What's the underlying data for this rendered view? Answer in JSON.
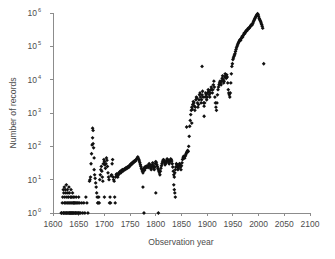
{
  "chart_data": {
    "type": "scatter",
    "title": "",
    "xlabel": "Observation year",
    "ylabel": "Number of records",
    "xlim": [
      1600,
      2100
    ],
    "ylim": [
      1,
      1000000
    ],
    "yscale": "log",
    "xscale": "linear",
    "grid": false,
    "legend": null,
    "marker": "diamond",
    "marker_color": "#111111",
    "xticks": [
      1600,
      1650,
      1700,
      1750,
      1800,
      1850,
      1900,
      1950,
      2000,
      2050,
      2100
    ],
    "xtick_labels": [
      "1600",
      "1650",
      "1700",
      "1750",
      "1800",
      "1850",
      "1900",
      "1950",
      "2000",
      "2050",
      "2100"
    ],
    "yticks": [
      1,
      10,
      100,
      1000,
      10000,
      100000,
      1000000
    ],
    "ytick_labels": [
      "10⁰",
      "10¹",
      "10²",
      "10³",
      "10⁴",
      "10⁵",
      "10⁶"
    ],
    "ytick_mantissa": [
      "10",
      "10",
      "10",
      "10",
      "10",
      "10",
      "10"
    ],
    "ytick_exponent": [
      "0",
      "1",
      "2",
      "3",
      "4",
      "5",
      "6"
    ],
    "points": [
      [
        1616,
        1
      ],
      [
        1617,
        1
      ],
      [
        1618,
        2
      ],
      [
        1619,
        3
      ],
      [
        1620,
        1
      ],
      [
        1620,
        5
      ],
      [
        1621,
        1
      ],
      [
        1621,
        4
      ],
      [
        1622,
        2
      ],
      [
        1622,
        6
      ],
      [
        1623,
        1
      ],
      [
        1623,
        3
      ],
      [
        1624,
        2
      ],
      [
        1624,
        5
      ],
      [
        1625,
        1
      ],
      [
        1625,
        4
      ],
      [
        1626,
        1
      ],
      [
        1626,
        7
      ],
      [
        1627,
        2
      ],
      [
        1627,
        3
      ],
      [
        1628,
        1
      ],
      [
        1628,
        5
      ],
      [
        1629,
        2
      ],
      [
        1629,
        4
      ],
      [
        1630,
        1
      ],
      [
        1630,
        3
      ],
      [
        1631,
        2
      ],
      [
        1631,
        6
      ],
      [
        1632,
        1
      ],
      [
        1632,
        4
      ],
      [
        1633,
        1
      ],
      [
        1633,
        2
      ],
      [
        1634,
        1
      ],
      [
        1634,
        3
      ],
      [
        1635,
        2
      ],
      [
        1635,
        5
      ],
      [
        1636,
        1
      ],
      [
        1636,
        3
      ],
      [
        1637,
        1
      ],
      [
        1637,
        2
      ],
      [
        1638,
        1
      ],
      [
        1638,
        4
      ],
      [
        1639,
        2
      ],
      [
        1639,
        3
      ],
      [
        1640,
        1
      ],
      [
        1640,
        2
      ],
      [
        1641,
        1
      ],
      [
        1641,
        3
      ],
      [
        1642,
        2
      ],
      [
        1643,
        1
      ],
      [
        1643,
        2
      ],
      [
        1644,
        1
      ],
      [
        1645,
        2
      ],
      [
        1645,
        3
      ],
      [
        1646,
        1
      ],
      [
        1647,
        2
      ],
      [
        1648,
        1
      ],
      [
        1649,
        2
      ],
      [
        1650,
        1
      ],
      [
        1650,
        3
      ],
      [
        1651,
        1
      ],
      [
        1652,
        2
      ],
      [
        1654,
        1
      ],
      [
        1656,
        2
      ],
      [
        1658,
        1
      ],
      [
        1660,
        2
      ],
      [
        1662,
        1
      ],
      [
        1664,
        3
      ],
      [
        1666,
        2
      ],
      [
        1668,
        1
      ],
      [
        1671,
        9
      ],
      [
        1672,
        10
      ],
      [
        1673,
        12
      ],
      [
        1674,
        30
      ],
      [
        1675,
        60
      ],
      [
        1676,
        110
      ],
      [
        1677,
        180
      ],
      [
        1677,
        350
      ],
      [
        1678,
        300
      ],
      [
        1678,
        120
      ],
      [
        1679,
        90
      ],
      [
        1680,
        45
      ],
      [
        1680,
        20
      ],
      [
        1681,
        14
      ],
      [
        1682,
        11
      ],
      [
        1683,
        8
      ],
      [
        1684,
        6
      ],
      [
        1685,
        4
      ],
      [
        1686,
        3
      ],
      [
        1687,
        2
      ],
      [
        1688,
        2
      ],
      [
        1689,
        3
      ],
      [
        1690,
        2
      ],
      [
        1691,
        10
      ],
      [
        1692,
        14
      ],
      [
        1693,
        20
      ],
      [
        1694,
        25
      ],
      [
        1695,
        18
      ],
      [
        1696,
        12
      ],
      [
        1697,
        9
      ],
      [
        1698,
        30
      ],
      [
        1699,
        40
      ],
      [
        1700,
        35
      ],
      [
        1700,
        3
      ],
      [
        1701,
        28
      ],
      [
        1702,
        22
      ],
      [
        1703,
        30
      ],
      [
        1704,
        45
      ],
      [
        1705,
        38
      ],
      [
        1706,
        25
      ],
      [
        1707,
        16
      ],
      [
        1708,
        12
      ],
      [
        1709,
        10
      ],
      [
        1710,
        2
      ],
      [
        1711,
        3
      ],
      [
        1712,
        2
      ],
      [
        1713,
        13
      ],
      [
        1714,
        14
      ],
      [
        1715,
        30
      ],
      [
        1716,
        40
      ],
      [
        1717,
        12
      ],
      [
        1718,
        10
      ],
      [
        1719,
        9
      ],
      [
        1720,
        3
      ],
      [
        1721,
        2
      ],
      [
        1722,
        12
      ],
      [
        1723,
        14
      ],
      [
        1724,
        15
      ],
      [
        1725,
        13
      ],
      [
        1726,
        12
      ],
      [
        1727,
        14
      ],
      [
        1728,
        16
      ],
      [
        1729,
        15
      ],
      [
        1730,
        17
      ],
      [
        1731,
        18
      ],
      [
        1732,
        16
      ],
      [
        1733,
        17
      ],
      [
        1734,
        19
      ],
      [
        1735,
        20
      ],
      [
        1736,
        18
      ],
      [
        1737,
        19
      ],
      [
        1738,
        20
      ],
      [
        1739,
        21
      ],
      [
        1740,
        20
      ],
      [
        1741,
        22
      ],
      [
        1742,
        21
      ],
      [
        1743,
        23
      ],
      [
        1744,
        22
      ],
      [
        1745,
        24
      ],
      [
        1746,
        23
      ],
      [
        1747,
        25
      ],
      [
        1748,
        24
      ],
      [
        1749,
        26
      ],
      [
        1750,
        28
      ],
      [
        1751,
        27
      ],
      [
        1752,
        30
      ],
      [
        1753,
        29
      ],
      [
        1754,
        32
      ],
      [
        1755,
        31
      ],
      [
        1756,
        34
      ],
      [
        1757,
        33
      ],
      [
        1758,
        36
      ],
      [
        1759,
        35
      ],
      [
        1760,
        38
      ],
      [
        1761,
        37
      ],
      [
        1762,
        40
      ],
      [
        1763,
        42
      ],
      [
        1764,
        45
      ],
      [
        1765,
        48
      ],
      [
        1766,
        44
      ],
      [
        1767,
        40
      ],
      [
        1768,
        36
      ],
      [
        1769,
        32
      ],
      [
        1770,
        28
      ],
      [
        1771,
        25
      ],
      [
        1772,
        22
      ],
      [
        1773,
        20
      ],
      [
        1774,
        18
      ],
      [
        1775,
        16
      ],
      [
        1775,
        6
      ],
      [
        1776,
        20
      ],
      [
        1777,
        22
      ],
      [
        1777,
        1
      ],
      [
        1778,
        19
      ],
      [
        1779,
        24
      ],
      [
        1780,
        22
      ],
      [
        1781,
        25
      ],
      [
        1782,
        24
      ],
      [
        1783,
        26
      ],
      [
        1784,
        25
      ],
      [
        1785,
        23
      ],
      [
        1786,
        27
      ],
      [
        1787,
        30
      ],
      [
        1788,
        28
      ],
      [
        1789,
        25
      ],
      [
        1790,
        22
      ],
      [
        1791,
        20
      ],
      [
        1792,
        24
      ],
      [
        1793,
        28
      ],
      [
        1794,
        32
      ],
      [
        1795,
        26
      ],
      [
        1796,
        22
      ],
      [
        1797,
        20
      ],
      [
        1798,
        24
      ],
      [
        1799,
        30
      ],
      [
        1800,
        35
      ],
      [
        1800,
        4
      ],
      [
        1801,
        32
      ],
      [
        1802,
        28
      ],
      [
        1803,
        25
      ],
      [
        1804,
        22
      ],
      [
        1805,
        20
      ],
      [
        1805,
        1
      ],
      [
        1806,
        18
      ],
      [
        1807,
        16
      ],
      [
        1808,
        14
      ],
      [
        1809,
        18
      ],
      [
        1810,
        22
      ],
      [
        1811,
        26
      ],
      [
        1812,
        30
      ],
      [
        1813,
        34
      ],
      [
        1814,
        38
      ],
      [
        1815,
        40
      ],
      [
        1816,
        36
      ],
      [
        1817,
        32
      ],
      [
        1818,
        28
      ],
      [
        1819,
        30
      ],
      [
        1820,
        34
      ],
      [
        1821,
        38
      ],
      [
        1822,
        42
      ],
      [
        1823,
        40
      ],
      [
        1824,
        36
      ],
      [
        1825,
        32
      ],
      [
        1826,
        30
      ],
      [
        1827,
        34
      ],
      [
        1828,
        38
      ],
      [
        1829,
        42
      ],
      [
        1830,
        40
      ],
      [
        1831,
        36
      ],
      [
        1832,
        30
      ],
      [
        1833,
        24
      ],
      [
        1834,
        18
      ],
      [
        1835,
        14
      ],
      [
        1835,
        7
      ],
      [
        1836,
        12
      ],
      [
        1836,
        5
      ],
      [
        1837,
        16
      ],
      [
        1837,
        4
      ],
      [
        1838,
        20
      ],
      [
        1838,
        3
      ],
      [
        1839,
        24
      ],
      [
        1840,
        30
      ],
      [
        1841,
        28
      ],
      [
        1842,
        24
      ],
      [
        1843,
        20
      ],
      [
        1844,
        22
      ],
      [
        1845,
        26
      ],
      [
        1846,
        30
      ],
      [
        1847,
        28
      ],
      [
        1848,
        24
      ],
      [
        1849,
        20
      ],
      [
        1850,
        26
      ],
      [
        1851,
        32
      ],
      [
        1852,
        40
      ],
      [
        1853,
        45
      ],
      [
        1854,
        50
      ],
      [
        1855,
        48
      ],
      [
        1856,
        44
      ],
      [
        1857,
        50
      ],
      [
        1858,
        55
      ],
      [
        1859,
        60
      ],
      [
        1860,
        65
      ],
      [
        1860,
        380
      ],
      [
        1861,
        70
      ],
      [
        1862,
        75
      ],
      [
        1863,
        70
      ],
      [
        1864,
        100
      ],
      [
        1865,
        200
      ],
      [
        1866,
        400
      ],
      [
        1867,
        600
      ],
      [
        1868,
        900
      ],
      [
        1869,
        1200
      ],
      [
        1870,
        1500
      ],
      [
        1870,
        500
      ],
      [
        1871,
        1300
      ],
      [
        1872,
        1800
      ],
      [
        1873,
        2200
      ],
      [
        1874,
        2000
      ],
      [
        1875,
        1600
      ],
      [
        1876,
        1200
      ],
      [
        1877,
        1500
      ],
      [
        1878,
        2500
      ],
      [
        1879,
        3000
      ],
      [
        1880,
        2800
      ],
      [
        1881,
        2000
      ],
      [
        1882,
        1500
      ],
      [
        1883,
        1800
      ],
      [
        1884,
        2500
      ],
      [
        1885,
        3500
      ],
      [
        1886,
        4000
      ],
      [
        1887,
        3000
      ],
      [
        1888,
        2000
      ],
      [
        1889,
        2500
      ],
      [
        1890,
        3500
      ],
      [
        1890,
        25000
      ],
      [
        1891,
        4500
      ],
      [
        1892,
        3000
      ],
      [
        1893,
        2000
      ],
      [
        1894,
        1600
      ],
      [
        1894,
        800
      ],
      [
        1895,
        2000
      ],
      [
        1896,
        3000
      ],
      [
        1897,
        4000
      ],
      [
        1898,
        3500
      ],
      [
        1899,
        2500
      ],
      [
        1900,
        3000
      ],
      [
        1901,
        4000
      ],
      [
        1902,
        5000
      ],
      [
        1903,
        4500
      ],
      [
        1904,
        3500
      ],
      [
        1905,
        3000
      ],
      [
        1906,
        4000
      ],
      [
        1907,
        5000
      ],
      [
        1908,
        6000
      ],
      [
        1909,
        5000
      ],
      [
        1910,
        4000
      ],
      [
        1911,
        5000
      ],
      [
        1912,
        7000
      ],
      [
        1913,
        9000
      ],
      [
        1914,
        6000
      ],
      [
        1915,
        3000
      ],
      [
        1916,
        2000
      ],
      [
        1917,
        1500
      ],
      [
        1918,
        1200
      ],
      [
        1919,
        2000
      ],
      [
        1920,
        3500
      ],
      [
        1921,
        5000
      ],
      [
        1922,
        6000
      ],
      [
        1923,
        7000
      ],
      [
        1924,
        8000
      ],
      [
        1925,
        9000
      ],
      [
        1926,
        8000
      ],
      [
        1927,
        7000
      ],
      [
        1928,
        9000
      ],
      [
        1929,
        11000
      ],
      [
        1930,
        13000
      ],
      [
        1931,
        10000
      ],
      [
        1932,
        8000
      ],
      [
        1933,
        9000
      ],
      [
        1934,
        12000
      ],
      [
        1935,
        15000
      ],
      [
        1936,
        13000
      ],
      [
        1937,
        11000
      ],
      [
        1938,
        14000
      ],
      [
        1939,
        12000
      ],
      [
        1940,
        8000
      ],
      [
        1941,
        5000
      ],
      [
        1942,
        4000
      ],
      [
        1943,
        3500
      ],
      [
        1944,
        3000
      ],
      [
        1945,
        4000
      ],
      [
        1946,
        8000
      ],
      [
        1947,
        15000
      ],
      [
        1948,
        25000
      ],
      [
        1949,
        30000
      ],
      [
        1950,
        40000
      ],
      [
        1951,
        45000
      ],
      [
        1952,
        50000
      ],
      [
        1953,
        55000
      ],
      [
        1954,
        60000
      ],
      [
        1955,
        70000
      ],
      [
        1956,
        80000
      ],
      [
        1957,
        90000
      ],
      [
        1958,
        100000
      ],
      [
        1959,
        110000
      ],
      [
        1960,
        120000
      ],
      [
        1961,
        130000
      ],
      [
        1962,
        140000
      ],
      [
        1963,
        150000
      ],
      [
        1964,
        160000
      ],
      [
        1965,
        150000
      ],
      [
        1966,
        170000
      ],
      [
        1967,
        180000
      ],
      [
        1968,
        200000
      ],
      [
        1969,
        190000
      ],
      [
        1970,
        210000
      ],
      [
        1971,
        230000
      ],
      [
        1972,
        250000
      ],
      [
        1973,
        240000
      ],
      [
        1974,
        260000
      ],
      [
        1975,
        280000
      ],
      [
        1976,
        300000
      ],
      [
        1977,
        290000
      ],
      [
        1978,
        310000
      ],
      [
        1979,
        330000
      ],
      [
        1980,
        350000
      ],
      [
        1981,
        340000
      ],
      [
        1982,
        360000
      ],
      [
        1983,
        380000
      ],
      [
        1984,
        400000
      ],
      [
        1985,
        420000
      ],
      [
        1986,
        450000
      ],
      [
        1987,
        430000
      ],
      [
        1988,
        470000
      ],
      [
        1989,
        500000
      ],
      [
        1990,
        550000
      ],
      [
        1991,
        600000
      ],
      [
        1992,
        650000
      ],
      [
        1993,
        700000
      ],
      [
        1994,
        750000
      ],
      [
        1995,
        800000
      ],
      [
        1996,
        850000
      ],
      [
        1997,
        900000
      ],
      [
        1998,
        950000
      ],
      [
        1999,
        900000
      ],
      [
        2000,
        800000
      ],
      [
        2001,
        700000
      ],
      [
        2002,
        650000
      ],
      [
        2003,
        600000
      ],
      [
        2004,
        550000
      ],
      [
        2005,
        500000
      ],
      [
        2006,
        450000
      ],
      [
        2007,
        400000
      ],
      [
        2008,
        350000
      ],
      [
        2010,
        30000
      ]
    ]
  }
}
